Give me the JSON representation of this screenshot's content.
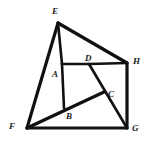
{
  "figure": {
    "background_color": "#ffffff",
    "stroke_color": "#111111",
    "label_color": "#1a1a1a",
    "width": 147,
    "height": 146,
    "vertices": [
      {
        "id": "E",
        "label": "E",
        "x": 58,
        "y": 23,
        "label_x": 52,
        "label_y": 7
      },
      {
        "id": "H",
        "label": "H",
        "x": 127,
        "y": 63,
        "label_x": 133,
        "label_y": 57
      },
      {
        "id": "A",
        "label": "A",
        "x": 62,
        "y": 64,
        "label_x": 52,
        "label_y": 70
      },
      {
        "id": "D",
        "label": "D",
        "x": 89,
        "y": 64,
        "label_x": 85,
        "label_y": 54
      },
      {
        "id": "C",
        "label": "C",
        "x": 104,
        "y": 92,
        "label_x": 108,
        "label_y": 90
      },
      {
        "id": "B",
        "label": "B",
        "x": 64,
        "y": 108,
        "label_x": 66,
        "label_y": 112
      },
      {
        "id": "F",
        "label": "F",
        "x": 27,
        "y": 128,
        "label_x": 9,
        "label_y": 122
      },
      {
        "id": "G",
        "label": "G",
        "x": 127,
        "y": 128,
        "label_x": 132,
        "label_y": 124
      }
    ],
    "segments": [
      {
        "id": "E-H",
        "from": "E",
        "to": "H",
        "weight": "thick"
      },
      {
        "id": "E-F",
        "from": "E",
        "to": "F",
        "weight": "thick"
      },
      {
        "id": "E-A",
        "from": "E",
        "to": "A",
        "weight": "med"
      },
      {
        "id": "A-D",
        "from": "A",
        "to": "D",
        "weight": "med"
      },
      {
        "id": "D-H",
        "from": "D",
        "to": "H",
        "weight": "med"
      },
      {
        "id": "A-B",
        "from": "A",
        "to": "B",
        "weight": "med"
      },
      {
        "id": "D-G",
        "from": "D",
        "to": "G",
        "weight": "med"
      },
      {
        "id": "F-C",
        "from": "F",
        "to": "C",
        "weight": "thick"
      },
      {
        "id": "H-G",
        "from": "H",
        "to": "G",
        "weight": "thick"
      },
      {
        "id": "F-G",
        "from": "F",
        "to": "G",
        "weight": "thick"
      }
    ]
  }
}
